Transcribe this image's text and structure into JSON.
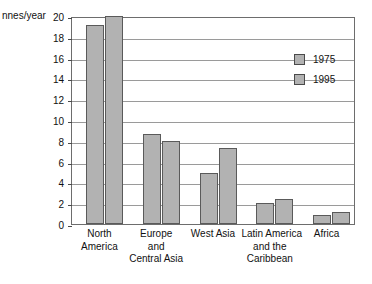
{
  "chart_data": {
    "type": "bar",
    "title": "",
    "subtitle": "",
    "xlabel": "",
    "ylabel": "nnes/year",
    "ylim": [
      0,
      20
    ],
    "ytick_step": 2,
    "yticks": [
      0,
      2,
      4,
      6,
      8,
      10,
      12,
      14,
      16,
      18,
      20
    ],
    "grid": true,
    "legend_position": "upper right inside plot",
    "categories": [
      "North\nAmerica",
      "Europe\nand\nCentral Asia",
      "West Asia",
      "Latin America\nand the\nCaribbean",
      "Africa"
    ],
    "category_lines": [
      [
        "North",
        "America"
      ],
      [
        "Europe",
        "and",
        "Central Asia"
      ],
      [
        "West Asia"
      ],
      [
        "Latin America",
        "and the",
        "Caribbean"
      ],
      [
        "Africa"
      ]
    ],
    "series": [
      {
        "name": "1975",
        "color": "#b2b2b2",
        "values": [
          19.1,
          8.7,
          4.9,
          2.0,
          0.9
        ]
      },
      {
        "name": "1995",
        "color": "#b2b2b2",
        "values": [
          20.0,
          8.0,
          7.3,
          2.4,
          1.2
        ]
      }
    ]
  },
  "legend": {
    "entries": [
      {
        "label": "1975"
      },
      {
        "label": "1995"
      }
    ]
  },
  "colors": {
    "bar_fill": "#b2b2b2",
    "bar_stroke": "#5a5a5a",
    "gridline": "#9a9a9a",
    "frame": "#6d6d6d",
    "text": "#111111",
    "background": "#ffffff"
  }
}
